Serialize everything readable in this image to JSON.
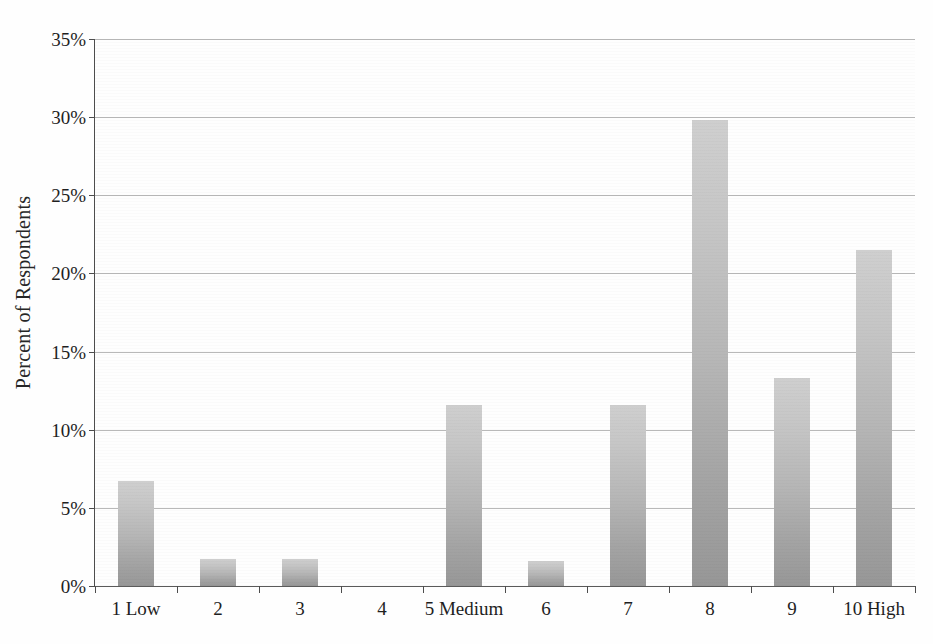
{
  "chart_data": {
    "type": "bar",
    "title": "",
    "xlabel": "",
    "ylabel": "Percent of Respondents",
    "categories": [
      "1 Low",
      "2",
      "3",
      "4",
      "5 Medium",
      "6",
      "7",
      "8",
      "9",
      "10 High"
    ],
    "values": [
      6.7,
      1.7,
      1.7,
      0,
      11.6,
      1.6,
      11.6,
      29.8,
      13.3,
      21.5
    ],
    "ylim": [
      0,
      35
    ],
    "y_ticks": [
      0,
      5,
      10,
      15,
      20,
      25,
      30,
      35
    ],
    "y_tick_labels": [
      "0%",
      "5%",
      "10%",
      "15%",
      "20%",
      "25%",
      "30%",
      "35%"
    ],
    "grid": true,
    "legend": "none",
    "series": [
      {
        "name": "Percent of Respondents",
        "values": [
          6.7,
          1.7,
          1.7,
          0,
          11.6,
          1.6,
          11.6,
          29.8,
          13.3,
          21.5
        ]
      }
    ]
  },
  "colors": {
    "bar_top": "#cfcfcf",
    "bar_bottom": "#979797",
    "gridline": "#8e8e8e",
    "axis": "#4d4d4d",
    "text": "#1f1f1f",
    "background": "#fefefe"
  }
}
